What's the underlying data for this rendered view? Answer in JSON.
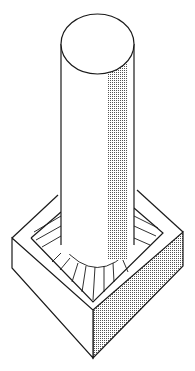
{
  "diagram": {
    "colors": {
      "stroke": "#1a1a1a",
      "shade": "#9a9a9a",
      "background": "#ffffff"
    },
    "elements": [
      "cylinder-column",
      "cylinder-top-ellipse",
      "square-base",
      "fillet-hatching",
      "shaded-side-face"
    ]
  }
}
